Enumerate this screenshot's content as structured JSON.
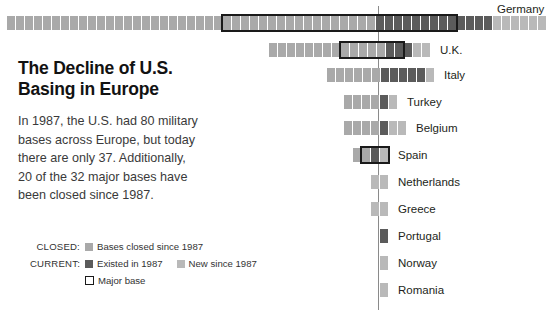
{
  "headline": {
    "line1": "The Decline of U.S.",
    "line2": "Basing in Europe"
  },
  "body": {
    "line1": "In 1987, the U.S. had 80 military",
    "line2": "bases across Europe, but today",
    "line3": "there are only 37. Additionally,",
    "line4": "20 of the 32 major bases have",
    "line5": "been closed since 1987."
  },
  "legend": {
    "closed_lead": "CLOSED:",
    "closed_text": "Bases closed since 1987",
    "current_lead": "CURRENT:",
    "existed_text": "Existed in 1987",
    "new_text": "New since 1987",
    "major_text": "Major base"
  },
  "colors": {
    "closed": "#a9a9a9",
    "existed": "#5b5b5b",
    "new": "#b9b9b9",
    "major_outline": "#1a1a1a",
    "axis": "#8a8a8a",
    "text": "#231f20"
  },
  "chart_data": {
    "type": "bar",
    "title": "The Decline of U.S. Basing in Europe",
    "xlabel": "",
    "ylabel": "",
    "grid": false,
    "legend_position": "bottom-left",
    "note": "Each square is one military base. Bars are centred on a vertical reference line; closed bases extend to the left, current bases to the right.",
    "axis_line_x": 378,
    "categories": [
      "Germany",
      "U.K.",
      "Italy",
      "Turkey",
      "Belgium",
      "Spain",
      "Netherlands",
      "Greece",
      "Portugal",
      "Norway",
      "Romania"
    ],
    "series": [
      {
        "name": "Bases closed since 1987",
        "values": [
          41,
          13,
          6,
          4,
          4,
          2,
          0,
          0,
          0,
          0,
          0
        ]
      },
      {
        "name": "Existed in 1987",
        "values": [
          13,
          3,
          5,
          1,
          1,
          1,
          0,
          0,
          1,
          0,
          0
        ]
      },
      {
        "name": "New since 1987",
        "values": [
          6,
          2,
          1,
          1,
          2,
          1,
          2,
          2,
          0,
          1,
          1
        ]
      }
    ],
    "rows": [
      {
        "country": "Germany",
        "closed": 41,
        "existed": 13,
        "new": 6,
        "major_base": true,
        "major_box": {
          "start_index": 24,
          "count": 26
        }
      },
      {
        "country": "U.K.",
        "closed": 13,
        "existed": 3,
        "new": 2,
        "major_base": true,
        "major_box": {
          "start_index": 8,
          "count": 7
        }
      },
      {
        "country": "Italy",
        "closed": 6,
        "existed": 5,
        "new": 1,
        "major_base": false
      },
      {
        "country": "Turkey",
        "closed": 4,
        "existed": 1,
        "new": 1,
        "major_base": false
      },
      {
        "country": "Belgium",
        "closed": 4,
        "existed": 1,
        "new": 2,
        "major_base": false
      },
      {
        "country": "Spain",
        "closed": 2,
        "existed": 1,
        "new": 1,
        "major_base": true,
        "major_box": {
          "start_index": 1,
          "count": 3
        }
      },
      {
        "country": "Netherlands",
        "closed": 0,
        "existed": 0,
        "new": 2,
        "major_base": false
      },
      {
        "country": "Greece",
        "closed": 0,
        "existed": 0,
        "new": 2,
        "major_base": false
      },
      {
        "country": "Portugal",
        "closed": 0,
        "existed": 1,
        "new": 0,
        "major_base": false
      },
      {
        "country": "Norway",
        "closed": 0,
        "existed": 0,
        "new": 1,
        "major_base": false
      },
      {
        "country": "Romania",
        "closed": 0,
        "existed": 0,
        "new": 1,
        "major_base": false
      }
    ],
    "row_geometry": [
      {
        "country": "Germany",
        "top": 16,
        "right_end": 546,
        "label_x": 497,
        "label_y": 2
      },
      {
        "country": "U.K.",
        "top": 43,
        "right_end": 430,
        "label_x": 440,
        "label_y": 43
      },
      {
        "country": "Italy",
        "top": 68,
        "right_end": 434,
        "label_x": 444,
        "label_y": 68
      },
      {
        "country": "Turkey",
        "top": 95,
        "right_end": 397,
        "label_x": 407,
        "label_y": 95
      },
      {
        "country": "Belgium",
        "top": 121,
        "right_end": 406,
        "label_x": 416,
        "label_y": 121
      },
      {
        "country": "Spain",
        "top": 148,
        "right_end": 388,
        "label_x": 398,
        "label_y": 148
      },
      {
        "country": "Netherlands",
        "top": 175,
        "right_end": 388,
        "label_x": 398,
        "label_y": 175
      },
      {
        "country": "Greece",
        "top": 202,
        "right_end": 388,
        "label_x": 398,
        "label_y": 202
      },
      {
        "country": "Portugal",
        "top": 229,
        "right_end": 388,
        "label_x": 398,
        "label_y": 229
      },
      {
        "country": "Norway",
        "top": 256,
        "right_end": 388,
        "label_x": 398,
        "label_y": 256
      },
      {
        "country": "Romania",
        "top": 283,
        "right_end": 388,
        "label_x": 398,
        "label_y": 283
      }
    ]
  }
}
